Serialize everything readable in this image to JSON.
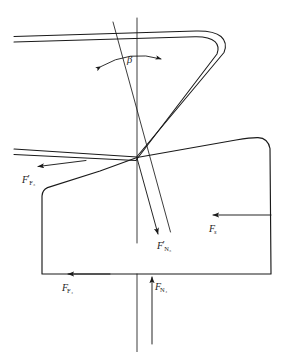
{
  "figure": {
    "type": "free-body-diagram",
    "background_color": "#ffffff",
    "line_color": "#1a1a1a",
    "width": 284,
    "height": 352
  },
  "labels": {
    "friction_force_3": {
      "symbol": "F",
      "prime": "′",
      "subscript": "F₃",
      "text": "F′F3"
    },
    "normal_force_3": {
      "symbol": "F",
      "prime": "′",
      "subscript": "N₃",
      "text": "F′N3"
    },
    "friction_force_4": {
      "symbol": "F",
      "prime": "",
      "subscript": "F₄",
      "text": "FF4"
    },
    "normal_force_4": {
      "symbol": "F",
      "prime": "",
      "subscript": "N₄",
      "text": "FN4"
    },
    "side_force": {
      "symbol": "F",
      "prime": "",
      "subscript": "s",
      "text": "Fs"
    },
    "angle_beta": {
      "symbol": "β",
      "prime": "",
      "subscript": "",
      "text": "β"
    }
  },
  "parts": {
    "strip": "bent-sheet-strip",
    "workpiece": "workpiece-body",
    "vertical_reference_line": "vertical-axis",
    "inclined_reference_line": "inclined-axis",
    "angle_arc": "beta-angle-arc"
  },
  "geometry": {
    "convergence_point": {
      "x": 137,
      "y": 158
    },
    "vertical_axis": {
      "x": 137,
      "top": 18,
      "bottom": 352
    },
    "inclined_axis": {
      "x1": 113,
      "y1": 22,
      "x2": 174,
      "y2": 243
    },
    "workpiece_bottom_y": 274,
    "workpiece_left_x": 42,
    "workpiece_right_x": 271
  }
}
